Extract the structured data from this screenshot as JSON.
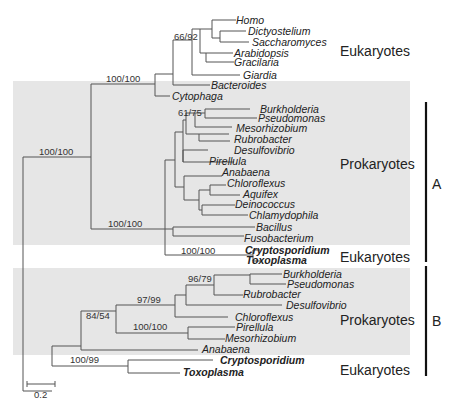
{
  "figure": {
    "type": "phylogenetic-tree",
    "scale_bar": {
      "label": "0.2"
    },
    "clade_brackets": [
      {
        "label": "A"
      },
      {
        "label": "B"
      }
    ],
    "group_labels": [
      {
        "label": "Eukaryotes"
      },
      {
        "label": "Prokaryotes"
      },
      {
        "label": "Eukaryotes"
      },
      {
        "label": "Prokaryotes"
      },
      {
        "label": "Eukaryotes"
      }
    ],
    "support_values": [
      "66/92",
      "100/100",
      "61/75",
      "100/100",
      "100/100",
      "100/100",
      "96/79",
      "97/99",
      "84/54",
      "100/100",
      "100/99"
    ],
    "taxa_A": [
      {
        "name": "Homo",
        "bold": false
      },
      {
        "name": "Dictyostelium",
        "bold": false
      },
      {
        "name": "Saccharomyces",
        "bold": false
      },
      {
        "name": "Arabidopsis",
        "bold": false
      },
      {
        "name": "Gracilaria",
        "bold": false
      },
      {
        "name": "Giardia",
        "bold": false
      },
      {
        "name": "Bacteroides",
        "bold": false
      },
      {
        "name": "Cytophaga",
        "bold": false
      },
      {
        "name": "Burkholderia",
        "bold": false
      },
      {
        "name": "Pseudomonas",
        "bold": false
      },
      {
        "name": "Mesorhizobium",
        "bold": false
      },
      {
        "name": "Rubrobacter",
        "bold": false
      },
      {
        "name": "Desulfovibrio",
        "bold": false
      },
      {
        "name": "Pirellula",
        "bold": false
      },
      {
        "name": "Anabaena",
        "bold": false
      },
      {
        "name": "Chloroflexus",
        "bold": false
      },
      {
        "name": "Aquifex",
        "bold": false
      },
      {
        "name": "Deinococcus",
        "bold": false
      },
      {
        "name": "Chlamydophila",
        "bold": false
      },
      {
        "name": "Bacillus",
        "bold": false
      },
      {
        "name": "Fusobacterium",
        "bold": false
      },
      {
        "name": "Cryptosporidium",
        "bold": true
      },
      {
        "name": "Toxoplasma",
        "bold": true
      }
    ],
    "taxa_B": [
      {
        "name": "Burkholderia",
        "bold": false
      },
      {
        "name": "Pseudomonas",
        "bold": false
      },
      {
        "name": "Rubrobacter",
        "bold": false
      },
      {
        "name": "Desulfovibrio",
        "bold": false
      },
      {
        "name": "Chloroflexus",
        "bold": false
      },
      {
        "name": "Pirellula",
        "bold": false
      },
      {
        "name": "Mesorhizobium",
        "bold": false
      },
      {
        "name": "Anabaena",
        "bold": false
      },
      {
        "name": "Cryptosporidium",
        "bold": true
      },
      {
        "name": "Toxoplasma",
        "bold": true
      }
    ],
    "colors": {
      "shade": "#e6e6e6",
      "branch": "#555555",
      "bracket": "#111111"
    }
  }
}
